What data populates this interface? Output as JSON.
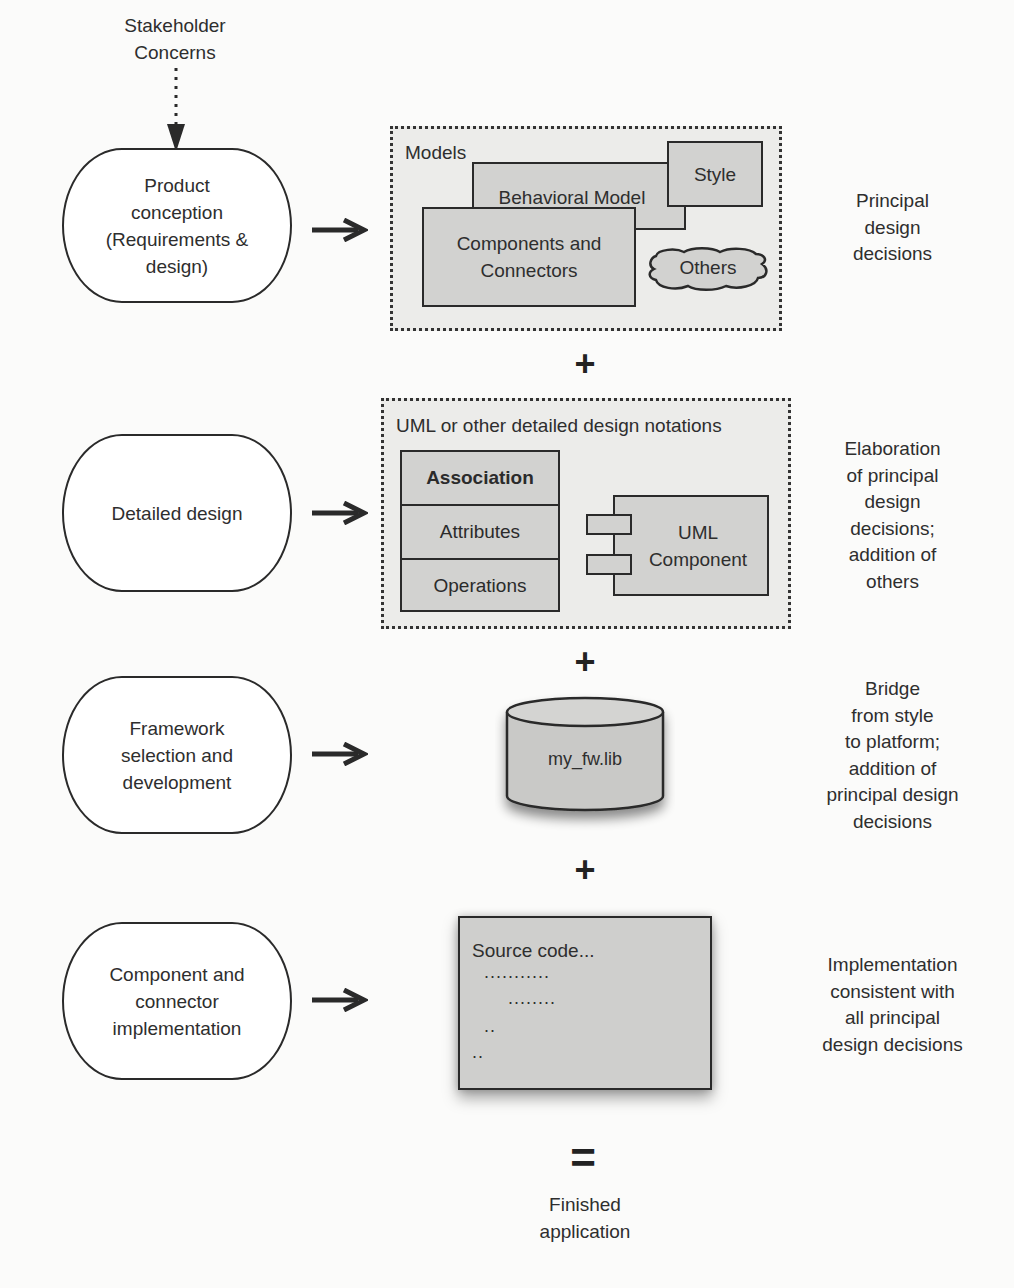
{
  "diagram": {
    "input": {
      "label": "Stakeholder\nConcerns"
    },
    "stages": [
      {
        "id": "product-conception",
        "label": "Product\nconception\n(Requirements &\ndesign)",
        "artifact": {
          "title": "Models",
          "items": [
            "Style",
            "Behavioral Model",
            "Components and\nConnectors",
            "Others"
          ]
        },
        "note": "Principal\ndesign\ndecisions"
      },
      {
        "id": "detailed-design",
        "label": "Detailed design",
        "artifact": {
          "title": "UML or other detailed design notations",
          "class_box": {
            "name": "Association",
            "compartments": [
              "Attributes",
              "Operations"
            ]
          },
          "component": "UML\nComponent"
        },
        "note": "Elaboration\nof principal\ndesign\ndecisions;\naddition of\nothers"
      },
      {
        "id": "framework-selection",
        "label": "Framework\nselection and\ndevelopment",
        "artifact": {
          "library": "my_fw.lib"
        },
        "note": "Bridge\nfrom style\nto platform;\naddition of\nprincipal design\ndecisions"
      },
      {
        "id": "component-implementation",
        "label": "Component and\nconnector\nimplementation",
        "artifact": {
          "title": "Source code...",
          "lines": [
            "...........",
            "........",
            "..",
            ".."
          ]
        },
        "note": "Implementation\nconsistent with\nall principal\ndesign decisions"
      }
    ],
    "operators": [
      "+",
      "+",
      "+",
      "="
    ],
    "output": {
      "label": "Finished\napplication"
    },
    "colors": {
      "line": "#2a2a2a",
      "artifact_fill": "#d2d2d0",
      "group_fill": "#ececea",
      "background": "#fbfbfa"
    }
  }
}
